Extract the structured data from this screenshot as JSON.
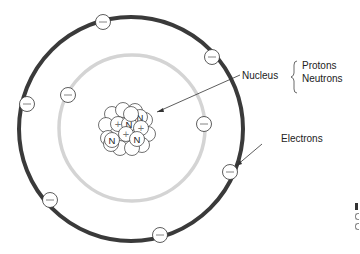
{
  "diagram": {
    "labels": {
      "nucleus": "Nucleus",
      "protons": "Protons",
      "neutrons": "Neutrons",
      "electrons": "Electrons"
    },
    "symbols": {
      "electron": "−",
      "proton": "+",
      "neutron": "N"
    },
    "colors": {
      "outer_orbit": "#3a3a3a",
      "inner_orbit": "#d4d4d4",
      "stroke": "#333333",
      "background": "#ffffff"
    },
    "orbits": [
      {
        "name": "inner",
        "cx": 132,
        "cy": 128,
        "r": 73
      },
      {
        "name": "outer",
        "cx": 131,
        "cy": 129,
        "r": 112
      }
    ],
    "electrons": [
      {
        "orbit": "outer",
        "x": 103,
        "y": 22
      },
      {
        "orbit": "outer",
        "x": 212,
        "y": 57
      },
      {
        "orbit": "outer",
        "x": 27,
        "y": 104
      },
      {
        "orbit": "outer",
        "x": 230,
        "y": 172
      },
      {
        "orbit": "outer",
        "x": 50,
        "y": 200
      },
      {
        "orbit": "outer",
        "x": 160,
        "y": 235
      },
      {
        "orbit": "inner",
        "x": 68,
        "y": 95
      },
      {
        "orbit": "inner",
        "x": 204,
        "y": 124
      }
    ],
    "edge_fragment": {
      "glyphs": [
        "l",
        "c",
        "c",
        "f"
      ]
    }
  }
}
